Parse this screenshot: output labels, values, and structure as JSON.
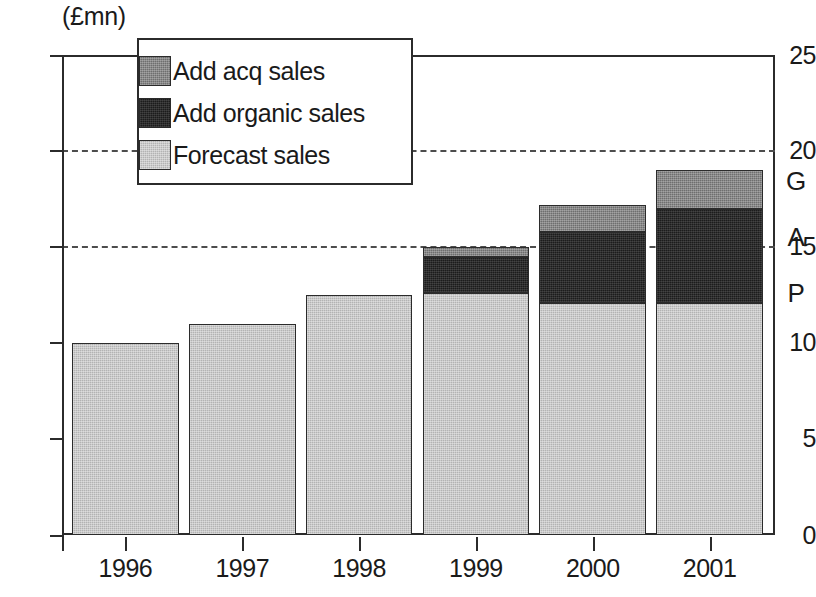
{
  "chart_data": {
    "type": "bar",
    "stacked": true,
    "title": "",
    "subtitle": "",
    "xlabel": "",
    "ylabel": "(£mn)",
    "unit_label": "(£mn)",
    "categories": [
      "1996",
      "1997",
      "1998",
      "1999",
      "2000",
      "2001"
    ],
    "ylim": [
      0,
      25
    ],
    "yticks": [
      0,
      5,
      10,
      15,
      20,
      25
    ],
    "ytick_labels": [
      "0",
      "5",
      "10",
      "15",
      "20",
      "25"
    ],
    "gridlines_at": [
      15,
      20
    ],
    "grid": true,
    "legend_position": "top-left-inside",
    "series": [
      {
        "name": "Forecast sales",
        "color": "#b3b3b3",
        "values": [
          10.0,
          11.0,
          12.5,
          12.6,
          12.1,
          12.1
        ]
      },
      {
        "name": "Add organic sales",
        "color": "#1c1c1c",
        "values": [
          0,
          0,
          0,
          1.9,
          3.7,
          4.9
        ]
      },
      {
        "name": "Add acq sales",
        "color": "#6e6e6e",
        "values": [
          0,
          0,
          0,
          0.5,
          1.4,
          2.0
        ]
      }
    ],
    "totals": [
      10.0,
      11.0,
      12.5,
      15.0,
      17.2,
      19.0
    ],
    "annotations": [
      "G",
      "A",
      "P"
    ]
  },
  "legend": {
    "items": [
      {
        "label": "Add acq sales",
        "color": "#6e6e6e",
        "swatch": "acq"
      },
      {
        "label": "Add organic sales",
        "color": "#1c1c1c",
        "swatch": "organic"
      },
      {
        "label": "Forecast sales",
        "color": "#b3b3b3",
        "swatch": "forecast"
      }
    ]
  },
  "axis": {
    "unit": "(£mn)",
    "y_labels": [
      "25",
      "20",
      "15",
      "10",
      "5",
      "0"
    ],
    "x_labels": [
      "1996",
      "1997",
      "1998",
      "1999",
      "2000",
      "2001"
    ]
  },
  "gap_annotation": {
    "letters": [
      "G",
      "A",
      "P"
    ],
    "text": "GAP"
  }
}
